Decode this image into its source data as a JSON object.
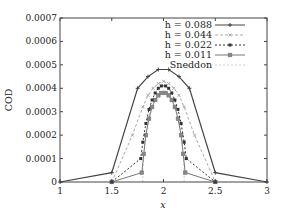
{
  "chart_data": {
    "type": "line",
    "title": "",
    "xlabel": "x",
    "ylabel": "COD",
    "xlim": [
      1,
      3
    ],
    "ylim": [
      0,
      0.0007
    ],
    "xticks": [
      "1",
      "1.5",
      "2",
      "2.5",
      "3"
    ],
    "yticks": [
      "0",
      "0.0001",
      "0.0002",
      "0.0003",
      "0.0004",
      "0.0005",
      "0.0006",
      "0.0007"
    ],
    "grid": false,
    "legend_position": "top-right",
    "series": [
      {
        "name": "h=0.088",
        "color": "#444444",
        "dash": "",
        "marker": "plus",
        "x": [
          1.0,
          1.5,
          1.75,
          1.85,
          1.95,
          2.05,
          2.15,
          2.25,
          2.5,
          3.0
        ],
        "y": [
          0.0,
          4e-05,
          0.0004,
          0.00045,
          0.00048,
          0.00048,
          0.00045,
          0.0004,
          4e-05,
          0.0
        ]
      },
      {
        "name": "h=0.044",
        "color": "#aaaaaa",
        "dash": "3,2",
        "marker": "x",
        "x": [
          1.5,
          1.7,
          1.8,
          1.85,
          1.9,
          1.95,
          2.0,
          2.05,
          2.1,
          2.15,
          2.2,
          2.3,
          2.5
        ],
        "y": [
          0.0,
          0.0002,
          0.00032,
          0.00037,
          0.0004,
          0.00042,
          0.00043,
          0.00042,
          0.0004,
          0.00037,
          0.00032,
          0.0002,
          0.0
        ]
      },
      {
        "name": "h=0.022",
        "color": "#333333",
        "dash": "2,2",
        "marker": "filled-square",
        "x": [
          1.5,
          1.78,
          1.8,
          1.83,
          1.86,
          1.89,
          1.92,
          1.95,
          1.98,
          2.02,
          2.05,
          2.08,
          2.11,
          2.14,
          2.17,
          2.2,
          2.22,
          2.5
        ],
        "y": [
          0.0,
          0.0001,
          0.00017,
          0.00025,
          0.00031,
          0.00035,
          0.00038,
          0.0004,
          0.00041,
          0.00041,
          0.0004,
          0.00038,
          0.00035,
          0.00031,
          0.00025,
          0.00017,
          0.0001,
          0.0
        ]
      },
      {
        "name": "h=0.011",
        "color": "#777777",
        "dash": "",
        "marker": "square",
        "x": [
          1.5,
          1.79,
          1.81,
          1.83,
          1.86,
          1.89,
          1.92,
          1.95,
          1.98,
          2.02,
          2.05,
          2.08,
          2.11,
          2.14,
          2.17,
          2.19,
          2.21,
          2.5
        ],
        "y": [
          0.0,
          4e-05,
          0.00012,
          0.0002,
          0.00027,
          0.00032,
          0.00035,
          0.00037,
          0.00038,
          0.00038,
          0.00037,
          0.00035,
          0.00032,
          0.00027,
          0.0002,
          0.00012,
          4e-05,
          0.0
        ]
      },
      {
        "name": "Sneddon",
        "color": "#cccccc",
        "dash": "2,2",
        "marker": "none",
        "x": [
          1.8,
          1.8,
          1.82,
          1.85,
          1.9,
          1.95,
          2.0,
          2.05,
          2.1,
          2.15,
          2.18,
          2.2,
          2.2
        ],
        "y": [
          0.0,
          5e-05,
          0.00018,
          0.00027,
          0.00034,
          0.00038,
          0.00039,
          0.00038,
          0.00034,
          0.00027,
          0.00018,
          5e-05,
          0.0
        ]
      }
    ]
  },
  "legend": {
    "items": [
      {
        "label": "h = 0.088"
      },
      {
        "label": "h = 0.044"
      },
      {
        "label": "h = 0.022"
      },
      {
        "label": "h = 0.011"
      },
      {
        "label": "Sneddon"
      }
    ]
  },
  "axes": {
    "xlabel": "x",
    "ylabel": "COD"
  }
}
